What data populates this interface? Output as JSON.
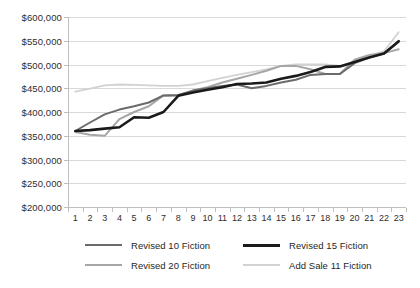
{
  "chart_data": {
    "type": "line",
    "title": "",
    "subtitle": "",
    "xlabel": "",
    "ylabel": "",
    "categories": [
      1,
      2,
      3,
      4,
      5,
      6,
      7,
      8,
      9,
      10,
      11,
      12,
      13,
      14,
      15,
      16,
      17,
      18,
      19,
      20,
      21,
      22,
      23
    ],
    "x_tick_labels": [
      "1",
      "2",
      "3",
      "4",
      "5",
      "6",
      "7",
      "8",
      "9",
      "10",
      "11",
      "12",
      "13",
      "14",
      "15",
      "16",
      "17",
      "18",
      "19",
      "20",
      "21",
      "22",
      "23"
    ],
    "y_tick_labels": [
      "$200,000",
      "$250,000",
      "$300,000",
      "$350,000",
      "$400,000",
      "$450,000",
      "$500,000",
      "$550,000",
      "$600,000"
    ],
    "y_tick_values": [
      200000,
      250000,
      300000,
      350000,
      400000,
      450000,
      500000,
      550000,
      600000
    ],
    "ylim": [
      200000,
      600000
    ],
    "y_step": 50000,
    "grid": "horizontal",
    "legend_position": "bottom",
    "legend_columns": 2,
    "series": [
      {
        "name": "Revised 10 Fiction",
        "color": "#6b6b6b",
        "width": 2.0,
        "values": [
          360000,
          378000,
          395000,
          405000,
          412000,
          420000,
          435000,
          436000,
          445000,
          450000,
          455000,
          458000,
          450000,
          455000,
          462000,
          468000,
          478000,
          480000,
          480000,
          503000,
          515000,
          523000,
          548000
        ]
      },
      {
        "name": "Revised 15 Fiction",
        "color": "#1a1a1a",
        "width": 2.6,
        "values": [
          360000,
          362000,
          365000,
          368000,
          389000,
          388000,
          400000,
          434000,
          441000,
          447000,
          452000,
          459000,
          460000,
          462000,
          470000,
          476000,
          484000,
          495000,
          496000,
          505000,
          515000,
          523000,
          549000
        ]
      },
      {
        "name": "Revised 20 Fiction",
        "color": "#a6a6a6",
        "width": 2.0,
        "values": [
          358000,
          352000,
          350000,
          385000,
          400000,
          412000,
          435000,
          434000,
          445000,
          452000,
          462000,
          470000,
          478000,
          487000,
          497000,
          497000,
          490000,
          480000,
          480000,
          510000,
          520000,
          524000,
          532000
        ]
      },
      {
        "name": "Add Sale 11 Fiction",
        "color": "#d2d2d2",
        "width": 1.8,
        "values": [
          443000,
          449000,
          456000,
          458000,
          457000,
          456000,
          455000,
          455000,
          458000,
          465000,
          472000,
          478000,
          484000,
          490000,
          497000,
          500000,
          500000,
          500000,
          497000,
          505000,
          518000,
          528000,
          568000
        ]
      }
    ]
  },
  "legend": {
    "items": [
      {
        "label": "Revised 10 Fiction"
      },
      {
        "label": "Revised 15 Fiction"
      },
      {
        "label": "Revised 20 Fiction"
      },
      {
        "label": "Add Sale 11 Fiction"
      }
    ]
  }
}
